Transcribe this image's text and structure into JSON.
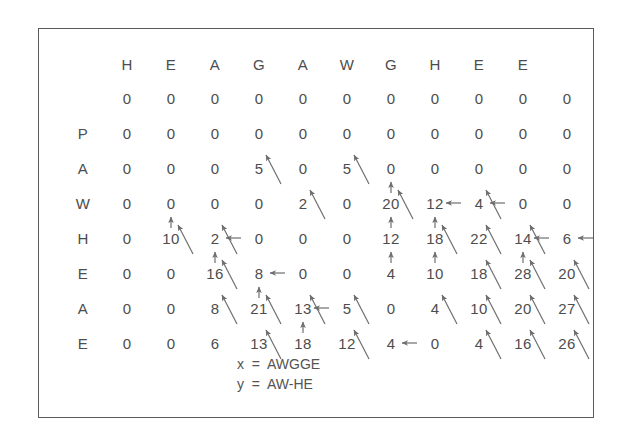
{
  "figure": {
    "type": "sequence-alignment-dp-matrix",
    "columns": [
      "",
      "H",
      "E",
      "A",
      "G",
      "A",
      "W",
      "G",
      "H",
      "E",
      "E"
    ],
    "rows": [
      "",
      "P",
      "A",
      "W",
      "H",
      "E",
      "A",
      "E"
    ],
    "matrix": [
      [
        0,
        0,
        0,
        0,
        0,
        0,
        0,
        0,
        0,
        0,
        0
      ],
      [
        0,
        0,
        0,
        0,
        0,
        0,
        0,
        0,
        0,
        0,
        0
      ],
      [
        0,
        0,
        0,
        5,
        0,
        5,
        0,
        0,
        0,
        0,
        0
      ],
      [
        0,
        0,
        0,
        0,
        2,
        0,
        20,
        12,
        4,
        0,
        0
      ],
      [
        0,
        10,
        2,
        0,
        0,
        0,
        12,
        18,
        22,
        14,
        6
      ],
      [
        0,
        0,
        16,
        8,
        0,
        0,
        4,
        10,
        18,
        28,
        20
      ],
      [
        0,
        0,
        8,
        21,
        13,
        5,
        0,
        4,
        10,
        20,
        27
      ],
      [
        0,
        0,
        6,
        13,
        18,
        12,
        4,
        0,
        4,
        16,
        26
      ]
    ],
    "pointers": [
      {
        "row": 2,
        "col": 3,
        "dir": "diag"
      },
      {
        "row": 2,
        "col": 5,
        "dir": "diag"
      },
      {
        "row": 3,
        "col": 4,
        "dir": "diag"
      },
      {
        "row": 3,
        "col": 6,
        "dir": "diag"
      },
      {
        "row": 3,
        "col": 6,
        "dir": "up"
      },
      {
        "row": 3,
        "col": 7,
        "dir": "left"
      },
      {
        "row": 3,
        "col": 8,
        "dir": "left"
      },
      {
        "row": 3,
        "col": 8,
        "dir": "diag"
      },
      {
        "row": 4,
        "col": 1,
        "dir": "diag"
      },
      {
        "row": 4,
        "col": 1,
        "dir": "up"
      },
      {
        "row": 4,
        "col": 2,
        "dir": "left"
      },
      {
        "row": 4,
        "col": 2,
        "dir": "diag"
      },
      {
        "row": 4,
        "col": 6,
        "dir": "up"
      },
      {
        "row": 4,
        "col": 7,
        "dir": "up"
      },
      {
        "row": 4,
        "col": 7,
        "dir": "diag"
      },
      {
        "row": 4,
        "col": 8,
        "dir": "diag"
      },
      {
        "row": 4,
        "col": 9,
        "dir": "left"
      },
      {
        "row": 4,
        "col": 9,
        "dir": "diag"
      },
      {
        "row": 4,
        "col": 10,
        "dir": "left"
      },
      {
        "row": 5,
        "col": 2,
        "dir": "up"
      },
      {
        "row": 5,
        "col": 2,
        "dir": "diag"
      },
      {
        "row": 5,
        "col": 3,
        "dir": "left"
      },
      {
        "row": 5,
        "col": 6,
        "dir": "up"
      },
      {
        "row": 5,
        "col": 7,
        "dir": "up"
      },
      {
        "row": 5,
        "col": 8,
        "dir": "diag"
      },
      {
        "row": 5,
        "col": 9,
        "dir": "up"
      },
      {
        "row": 5,
        "col": 9,
        "dir": "diag"
      },
      {
        "row": 5,
        "col": 10,
        "dir": "diag"
      },
      {
        "row": 6,
        "col": 2,
        "dir": "diag"
      },
      {
        "row": 6,
        "col": 3,
        "dir": "up"
      },
      {
        "row": 6,
        "col": 3,
        "dir": "diag"
      },
      {
        "row": 6,
        "col": 4,
        "dir": "left"
      },
      {
        "row": 6,
        "col": 4,
        "dir": "diag"
      },
      {
        "row": 6,
        "col": 5,
        "dir": "diag"
      },
      {
        "row": 6,
        "col": 7,
        "dir": "diag"
      },
      {
        "row": 6,
        "col": 8,
        "dir": "diag"
      },
      {
        "row": 6,
        "col": 9,
        "dir": "diag"
      },
      {
        "row": 6,
        "col": 10,
        "dir": "diag"
      },
      {
        "row": 7,
        "col": 3,
        "dir": "diag"
      },
      {
        "row": 7,
        "col": 4,
        "dir": "up"
      },
      {
        "row": 7,
        "col": 5,
        "dir": "diag"
      },
      {
        "row": 7,
        "col": 6,
        "dir": "left"
      },
      {
        "row": 7,
        "col": 8,
        "dir": "diag"
      },
      {
        "row": 7,
        "col": 9,
        "dir": "diag"
      },
      {
        "row": 7,
        "col": 10,
        "dir": "diag"
      }
    ]
  },
  "legend": {
    "x_line": "x  =  AWGGE",
    "y_line": "y  =  AW-HE"
  },
  "colors": {
    "text": "#4d4d4d",
    "arrow": "#6e6e6e",
    "border": "#5a5a5a",
    "background": "#ffffff"
  }
}
